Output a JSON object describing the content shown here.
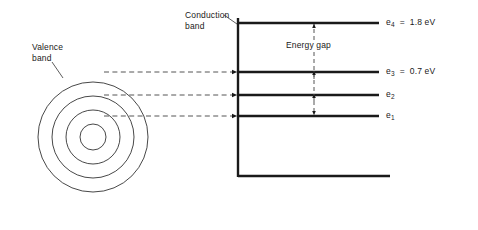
{
  "figure": {
    "background_color": "#ffffff",
    "line_color": "#1a1a1a",
    "dash_color": "#555555",
    "circle_color": "#333333",
    "width": 478,
    "height": 230
  },
  "labels": {
    "conduction_band": "Conduction\nband",
    "valence_band": "Valence\nband",
    "energy_gap": "Energy gap"
  },
  "energy_levels": [
    {
      "id": "e4",
      "symbol": "e",
      "subscript": "4",
      "text": "e4  =  1.8 eV",
      "value": "1.8",
      "unit": "eV",
      "y": 23
    },
    {
      "id": "e3",
      "symbol": "e",
      "subscript": "3",
      "text": "e3  =  0.7 eV",
      "value": "0.7",
      "unit": "eV",
      "y": 72
    },
    {
      "id": "e2",
      "symbol": "e",
      "subscript": "2",
      "text": "e2",
      "value": "",
      "unit": "",
      "y": 95
    },
    {
      "id": "e1",
      "symbol": "e",
      "subscript": "1",
      "text": "e1",
      "value": "",
      "unit": "",
      "y": 116
    }
  ],
  "atom": {
    "center_x": 93,
    "center_y": 137,
    "shell_radii": [
      13,
      27,
      41,
      55
    ],
    "shell_count": 4
  },
  "axis": {
    "vertical_x": 238,
    "top_y": 18,
    "bottom_y": 176,
    "baseline_right_x": 390
  },
  "energy_gap_arrow": {
    "x": 314,
    "top_y": 23,
    "bottom_y": 116
  },
  "transition_arrows": [
    {
      "from_shell": 4,
      "to_level": "e3",
      "y": 72
    },
    {
      "from_shell": 3,
      "to_level": "e2",
      "y": 95
    },
    {
      "from_shell": 2,
      "to_level": "e1",
      "y": 116
    }
  ],
  "chart_data": {
    "type": "diagram",
    "levels": [
      {
        "label": "e4",
        "energy_eV": 1.8
      },
      {
        "label": "e3",
        "energy_eV": 0.7
      },
      {
        "label": "e2",
        "energy_eV": null
      },
      {
        "label": "e1",
        "energy_eV": null
      }
    ],
    "annotations": [
      "Conduction band",
      "Valence band",
      "Energy gap"
    ]
  }
}
